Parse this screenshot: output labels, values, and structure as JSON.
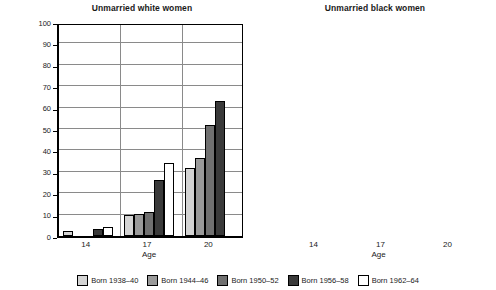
{
  "figure": {
    "ylabel": "Percentage",
    "xlabel_left": "Age",
    "xlabel_right": "Age"
  },
  "panels": [
    {
      "title": "Unmarried white women"
    },
    {
      "title": "Unmarried black women"
    }
  ],
  "legend": [
    {
      "label": "Born 1938–40",
      "color": "#d4d4d4"
    },
    {
      "label": "Born 1944–46",
      "color": "#9a9a9a"
    },
    {
      "label": "Born 1950–52",
      "color": "#707070"
    },
    {
      "label": "Born 1956–58",
      "color": "#3a3a3a"
    },
    {
      "label": "Born 1962–64",
      "color": "#ffffff"
    }
  ],
  "yticks": [
    "0",
    "10",
    "20",
    "30",
    "40",
    "50",
    "60",
    "70",
    "80",
    "90",
    "100"
  ],
  "xticks": [
    "14",
    "17",
    "20"
  ],
  "chart_data": [
    {
      "type": "bar",
      "title": "Unmarried white women",
      "xlabel": "Age",
      "ylabel": "Percentage",
      "ylim": [
        0,
        100
      ],
      "ytick_interval": 10,
      "grid": true,
      "legend_position": "bottom-shared",
      "categories": [
        "14",
        "17",
        "20"
      ],
      "series": [
        {
          "name": "Born 1938–40",
          "color": "#d4d4d4",
          "values": [
            2.5,
            10,
            32
          ]
        },
        {
          "name": "Born 1944–46",
          "color": "#9a9a9a",
          "values": [
            0,
            10.5,
            36.5
          ]
        },
        {
          "name": "Born 1950–52",
          "color": "#707070",
          "values": [
            0,
            11,
            52
          ]
        },
        {
          "name": "Born 1956–58",
          "color": "#3a3a3a",
          "values": [
            3.5,
            26,
            63
          ]
        },
        {
          "name": "Born 1962–64",
          "color": "#ffffff",
          "values": [
            4,
            34,
            null
          ]
        }
      ]
    },
    {
      "type": "bar",
      "title": "Unmarried black women",
      "xlabel": "Age",
      "ylabel": "Percentage",
      "ylim": [
        0,
        100
      ],
      "ytick_interval": 10,
      "grid": true,
      "legend_position": "bottom-shared",
      "categories": [
        "14",
        "17",
        "20"
      ],
      "series": [
        {
          "name": "Born 1938–40",
          "color": "#d4d4d4",
          "values": [
            7,
            41,
            79
          ]
        },
        {
          "name": "Born 1944–46",
          "color": "#9a9a9a",
          "values": [
            6,
            33,
            72.5
          ]
        },
        {
          "name": "Born 1950–52",
          "color": "#707070",
          "values": [
            4.5,
            33,
            80
          ]
        },
        {
          "name": "Born 1956–58",
          "color": "#3a3a3a",
          "values": [
            6,
            42.5,
            88
          ]
        },
        {
          "name": "Born 1962–64",
          "color": "#ffffff",
          "values": [
            6.5,
            55.5,
            null
          ]
        }
      ]
    }
  ]
}
